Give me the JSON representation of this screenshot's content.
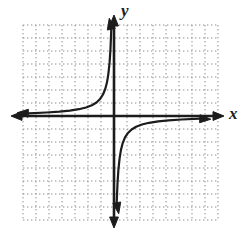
{
  "figure": {
    "width_px": 249,
    "height_px": 241
  },
  "chart_data": {
    "type": "line",
    "equation": "x * y = -1.4 (in grid-square units)",
    "xlabel": "x",
    "ylabel": "y",
    "tick_labels": "none",
    "xlim": [
      -7,
      8
    ],
    "ylim": [
      -8,
      7
    ],
    "grid": {
      "columns": 15,
      "rows": 15,
      "style": "dotted",
      "cell_px": 13
    },
    "axes": {
      "origin_col": 7,
      "origin_row": 7,
      "arrowheads": "both ends of both axes",
      "asymptotes": "x-axis and y-axis"
    },
    "series": [
      {
        "name": "branch-quadrant-II",
        "arrow_ends": [
          "left-along-x-axis",
          "up-along-y-axis"
        ],
        "points": [
          [
            -6.6,
            0.21
          ],
          [
            -5.2,
            0.27
          ],
          [
            -4.2,
            0.33
          ],
          [
            -3.4,
            0.41
          ],
          [
            -2.7,
            0.52
          ],
          [
            -2.15,
            0.65
          ],
          [
            -1.7,
            0.82
          ],
          [
            -1.35,
            1.04
          ],
          [
            -1.05,
            1.33
          ],
          [
            -0.85,
            1.65
          ],
          [
            -0.68,
            2.06
          ],
          [
            -0.54,
            2.59
          ],
          [
            -0.43,
            3.26
          ],
          [
            -0.34,
            4.12
          ],
          [
            -0.27,
            5.19
          ],
          [
            -0.21,
            6.67
          ]
        ]
      },
      {
        "name": "branch-quadrant-IV",
        "arrow_ends": [
          "down-along-y-axis",
          "right-along-x-axis"
        ],
        "points": [
          [
            0.21,
            -6.67
          ],
          [
            0.27,
            -5.19
          ],
          [
            0.34,
            -4.12
          ],
          [
            0.43,
            -3.26
          ],
          [
            0.54,
            -2.59
          ],
          [
            0.68,
            -2.06
          ],
          [
            0.85,
            -1.65
          ],
          [
            1.05,
            -1.33
          ],
          [
            1.35,
            -1.04
          ],
          [
            1.7,
            -0.82
          ],
          [
            2.15,
            -0.65
          ],
          [
            2.7,
            -0.52
          ],
          [
            3.4,
            -0.41
          ],
          [
            4.2,
            -0.33
          ],
          [
            5.2,
            -0.27
          ],
          [
            6.6,
            -0.21
          ]
        ]
      }
    ],
    "legend": "none"
  },
  "colors": {
    "background": "#ffffff",
    "axis": "#1c1c1c",
    "curve": "#1c1c1c",
    "grid_dots": "#8e8e8e",
    "label": "#1c1c1c"
  }
}
